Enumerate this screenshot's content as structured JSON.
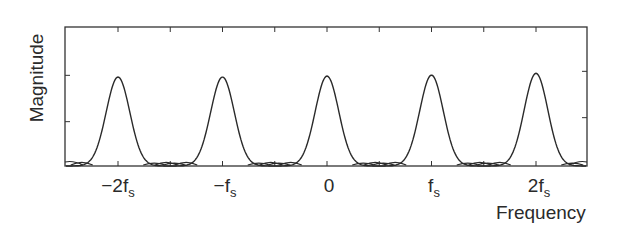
{
  "chart_data": {
    "type": "line",
    "title": "",
    "xlabel": "Frequency",
    "ylabel": "Magnitude",
    "x_ticks": [
      {
        "main": "−2f",
        "sub": "s",
        "value": -2
      },
      {
        "main": "−f",
        "sub": "s",
        "value": -1
      },
      {
        "main": "0",
        "sub": "",
        "value": 0
      },
      {
        "main": "f",
        "sub": "s",
        "value": 1
      },
      {
        "main": "2f",
        "sub": "s",
        "value": 2
      }
    ],
    "y_ticks": [
      "",
      "",
      ""
    ],
    "grid": false,
    "legend": null,
    "xlim": [
      -2.55,
      2.55
    ],
    "ylim": [
      0,
      1.5
    ],
    "series": [
      {
        "name": "spectrum",
        "description": "Periodic spectrum: identical Gaussian-like main lobes centered at multiples of the sampling frequency fs, with small side lobes between them",
        "peak_centers": [
          -2,
          -1,
          0,
          1,
          2
        ],
        "peak_heights": [
          0.96,
          0.96,
          0.97,
          0.98,
          1.0
        ],
        "peak_halfwidth_fs": 0.26,
        "sidelobe_height": 0.04
      }
    ]
  }
}
